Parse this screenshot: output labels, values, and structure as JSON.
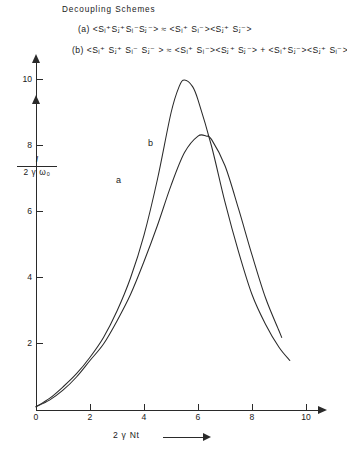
{
  "header": {
    "title": "Decoupling  Schemes",
    "formula_a": "(a)  <Sᵢ⁺Sⱼ⁺Sᵢ⁻Sⱼ⁻> ≈ <Sᵢ⁺ Sᵢ⁻><Sⱼ⁺ Sⱼ⁻>",
    "formula_b": "(b)  <Sᵢ⁺ Sⱼ⁺ Sᵢ⁻ Sⱼ⁻ > ≈ <Sᵢ⁺ Sᵢ⁻><Sⱼ⁺ Sⱼ⁻> + <Sᵢ⁺Sⱼ⁻><Sⱼ⁺ Sᵢ⁻>"
  },
  "axes": {
    "y_label_numerator": "I",
    "y_label_denominator": "2 γ ω₀",
    "x_label": "2 γ Nt",
    "x_ticks": [
      "0",
      "2",
      "4",
      "6",
      "8",
      "10"
    ],
    "y_ticks": [
      "2",
      "4",
      "6",
      "8",
      "10"
    ]
  },
  "curves": {
    "label_a": "a",
    "label_b": "b"
  },
  "colors": {
    "ink": "#2a2a2a",
    "background": "#ffffff"
  },
  "chart_data": {
    "type": "line",
    "title": "Decoupling Schemes",
    "xlabel": "2 γ Nt",
    "ylabel": "I / 2 γ ω₀",
    "xlim": [
      0,
      10.4
    ],
    "ylim": [
      0,
      10.8
    ],
    "grid": false,
    "legend": "inline-curve-labels",
    "x_ticks": [
      0,
      2,
      4,
      6,
      8,
      10
    ],
    "y_ticks": [
      2,
      4,
      6,
      8,
      10
    ],
    "series": [
      {
        "name": "a",
        "annotation": "a",
        "peak_x": 5.5,
        "peak_y": 10.0,
        "x": [
          0.0,
          0.5,
          1.0,
          1.5,
          2.0,
          2.5,
          3.0,
          3.5,
          4.0,
          4.5,
          5.0,
          5.3,
          5.5,
          5.8,
          6.0,
          6.5,
          7.0,
          7.5,
          8.0,
          8.5,
          9.0,
          9.4
        ],
        "values": [
          0.1,
          0.35,
          0.7,
          1.1,
          1.6,
          2.2,
          3.0,
          4.0,
          5.3,
          7.0,
          9.0,
          9.8,
          10.0,
          9.8,
          9.4,
          8.0,
          6.3,
          4.8,
          3.5,
          2.6,
          1.9,
          1.5
        ]
      },
      {
        "name": "b",
        "annotation": "b",
        "peak_x": 6.0,
        "peak_y": 8.3,
        "x": [
          0.0,
          0.5,
          1.0,
          1.5,
          2.0,
          2.5,
          3.0,
          3.5,
          4.0,
          4.5,
          5.0,
          5.5,
          6.0,
          6.3,
          6.5,
          7.0,
          7.5,
          8.0,
          8.5,
          9.0,
          9.1
        ],
        "values": [
          0.1,
          0.3,
          0.6,
          1.0,
          1.5,
          2.0,
          2.7,
          3.5,
          4.5,
          5.6,
          6.8,
          7.8,
          8.3,
          8.3,
          8.2,
          7.4,
          6.1,
          4.7,
          3.4,
          2.4,
          2.2
        ]
      }
    ]
  }
}
